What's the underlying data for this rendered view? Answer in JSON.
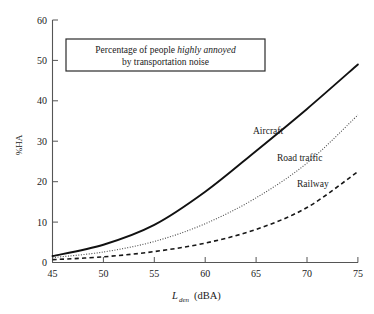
{
  "chart_data": {
    "type": "line",
    "title": "Percentage of people highly annoyed by transportation noise",
    "title_lines": [
      {
        "plain_before": "Percentage of people ",
        "emphasis": "highly annoyed",
        "plain_after": ""
      },
      {
        "plain_before": "by transportation noise",
        "emphasis": "",
        "plain_after": ""
      }
    ],
    "xlabel": "L_den (dBA)",
    "xlabel_parts": {
      "symbol": "L",
      "subscript": "den",
      "unit": "(dBA)"
    },
    "ylabel": "%HA",
    "xlim": [
      45,
      75
    ],
    "ylim": [
      0,
      60
    ],
    "xticks": [
      45,
      50,
      55,
      60,
      65,
      70,
      75
    ],
    "yticks": [
      0,
      10,
      20,
      30,
      40,
      50,
      60
    ],
    "grid": false,
    "legend_position": "inline-annotations",
    "x": [
      45,
      50,
      55,
      60,
      65,
      70,
      75
    ],
    "series": [
      {
        "name": "Aircraft",
        "style": "solid",
        "color": "#111111",
        "label_x": 66.5,
        "label_y": 31.5,
        "values": [
          1.6,
          4.4,
          9.3,
          17.5,
          27.6,
          38.0,
          49.0
        ]
      },
      {
        "name": "Road traffic",
        "style": "dotted",
        "color": "#4a4a4a",
        "label_x": 68.0,
        "label_y": 24.0,
        "values": [
          1.2,
          2.6,
          5.2,
          9.6,
          16.0,
          24.6,
          36.5
        ]
      },
      {
        "name": "Railway",
        "style": "dashed",
        "color": "#171717",
        "label_x": 70.0,
        "label_y": 17.0,
        "values": [
          0.7,
          1.4,
          2.7,
          4.8,
          8.2,
          13.6,
          22.5
        ]
      }
    ]
  }
}
